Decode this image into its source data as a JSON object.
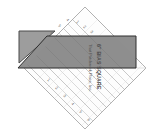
{
  "scene": {
    "title": "Bias square quilting ruler over gray fabric pieces",
    "background_color": "#ffffff",
    "width": 150,
    "height": 138
  },
  "ruler": {
    "name": "6\" BIAS SQUARE",
    "brand_line": "That Patchwork Place, Inc.",
    "shape": "square rotated 45 degrees (diamond)",
    "body_color": "#fdfdfd",
    "edge_color": "#9a9a9a",
    "grid_line_color": "#b9b9b9",
    "center_x": 85,
    "center_y": 68,
    "half_diagonal": 61,
    "grid_lines": 13,
    "tick_labels": [
      "1",
      "2",
      "3",
      "4",
      "5",
      "6",
      "1",
      "2",
      "3",
      "4",
      "5",
      "6"
    ],
    "text_color": "#5a5a5a"
  },
  "fabric_pieces": [
    {
      "label": "small triangle",
      "fill": "#9d9d9d",
      "stroke": "#4a4a4a",
      "points": "19,31 55,31 19,63"
    },
    {
      "label": "large parallelogram",
      "fill": "#8f8f8f",
      "stroke": "#2e2e2e",
      "points": "47,36 136,36 136,68 18,68"
    }
  ]
}
